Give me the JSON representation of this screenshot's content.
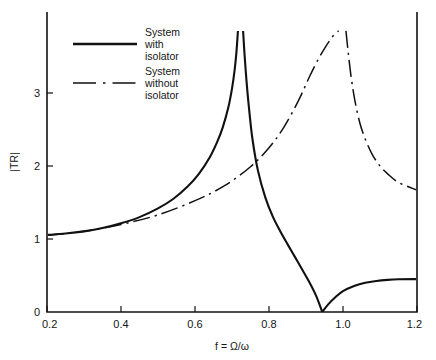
{
  "chart_data": {
    "type": "line",
    "title": "",
    "xlabel": "f = Ω/ω",
    "ylabel": "|TR|",
    "xlim": [
      0.2,
      1.2
    ],
    "ylim": [
      0,
      3.85
    ],
    "grid": false,
    "legend_position": "top-left-inside",
    "xticks": [
      "0.2",
      "0.4",
      "0.6",
      "0.8",
      "1.0",
      "1.2"
    ],
    "xtick_values": [
      0.2,
      0.4,
      0.6,
      0.8,
      1.0,
      1.2
    ],
    "yticks": [
      "0",
      "1",
      "2",
      "3"
    ],
    "ytick_values": [
      0,
      1,
      2,
      3
    ],
    "series": [
      {
        "name": "System with isolator",
        "style": "solid",
        "color": "#111111",
        "asymptote_x": 0.723,
        "zero_x": 0.944,
        "branches": [
          {
            "comment": "rising branch toward vertical asymptote at f=0.723",
            "x": [
              0.2,
              0.25,
              0.3,
              0.35,
              0.4,
              0.45,
              0.5,
              0.54,
              0.58,
              0.61,
              0.64,
              0.66,
              0.675,
              0.69,
              0.7,
              0.707,
              0.712,
              0.716
            ],
            "y": [
              1.055,
              1.075,
              1.105,
              1.15,
              1.215,
              1.3,
              1.42,
              1.545,
              1.72,
              1.89,
              2.12,
              2.33,
              2.53,
              2.8,
              3.06,
              3.31,
              3.56,
              3.85
            ]
          },
          {
            "comment": "descending branch right of asymptote down to zero at f=0.944",
            "x": [
              0.73,
              0.734,
              0.739,
              0.745,
              0.755,
              0.77,
              0.79,
              0.81,
              0.83,
              0.85,
              0.87,
              0.89,
              0.91,
              0.928,
              0.944
            ],
            "y": [
              3.85,
              3.52,
              3.18,
              2.84,
              2.38,
              1.94,
              1.57,
              1.31,
              1.11,
              0.93,
              0.755,
              0.58,
              0.4,
              0.215,
              0.0
            ]
          },
          {
            "comment": "rising branch after zero up to right edge",
            "x": [
              0.944,
              0.96,
              0.98,
              1.0,
              1.03,
              1.06,
              1.09,
              1.12,
              1.15,
              1.2
            ],
            "y": [
              0.0,
              0.105,
              0.205,
              0.285,
              0.355,
              0.4,
              0.425,
              0.44,
              0.448,
              0.45
            ]
          }
        ]
      },
      {
        "name": "System without isolator",
        "style": "dash-dot",
        "color": "#111111",
        "asymptote_x": 0.997,
        "branches": [
          {
            "comment": "rising branch toward vertical asymptote at f=1.0",
            "x": [
              0.2,
              0.3,
              0.4,
              0.5,
              0.6,
              0.68,
              0.75,
              0.8,
              0.84,
              0.88,
              0.91,
              0.935,
              0.955,
              0.97,
              0.98,
              0.988
            ],
            "y": [
              1.05,
              1.105,
              1.2,
              1.33,
              1.525,
              1.73,
              1.99,
              2.25,
              2.53,
              2.9,
              3.23,
              3.48,
              3.65,
              3.76,
              3.82,
              3.85
            ]
          },
          {
            "comment": "descending branch right of asymptote to right edge",
            "x": [
              1.008,
              1.014,
              1.022,
              1.032,
              1.045,
              1.06,
              1.08,
              1.1,
              1.12,
              1.15,
              1.2
            ],
            "y": [
              3.85,
              3.56,
              3.22,
              2.9,
              2.6,
              2.37,
              2.15,
              2.0,
              1.895,
              1.775,
              1.67
            ]
          }
        ]
      }
    ]
  },
  "legend": {
    "entries": [
      {
        "line1": "System",
        "line2": "with",
        "line3": "isolator",
        "style": "solid"
      },
      {
        "line1": "System",
        "line2": "without",
        "line3": "isolator",
        "style": "dash-dot"
      }
    ]
  },
  "axes": {
    "x_label": "f = Ω/ω",
    "y_label": "|TR|",
    "x_tick_labels": [
      "0.2",
      "0.4",
      "0.6",
      "0.8",
      "1.0",
      "1.2"
    ],
    "y_tick_labels": [
      "0",
      "1",
      "2",
      "3"
    ]
  }
}
